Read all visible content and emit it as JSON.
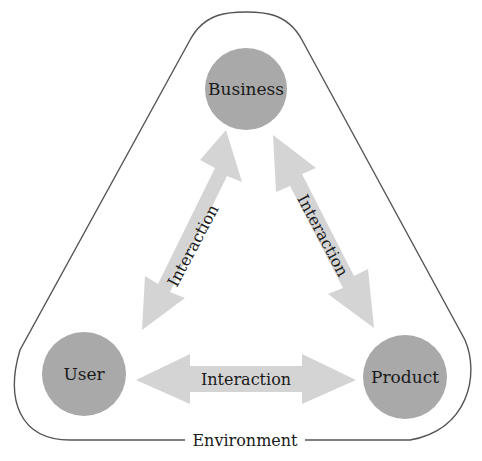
{
  "diagram": {
    "boundary": {
      "label": "Environment",
      "stroke": "#555555"
    },
    "nodes": [
      {
        "id": "business",
        "label": "Business",
        "cx": 246,
        "cy": 89,
        "r": 41,
        "fill": "#a9a9a9"
      },
      {
        "id": "user",
        "label": "User",
        "cx": 84,
        "cy": 374,
        "r": 42,
        "fill": "#a9a9a9"
      },
      {
        "id": "product",
        "label": "Product",
        "cx": 405,
        "cy": 377,
        "r": 42,
        "fill": "#a9a9a9"
      }
    ],
    "edges": [
      {
        "from": "user",
        "to": "business",
        "label": "Interaction",
        "bidirectional": true
      },
      {
        "from": "business",
        "to": "product",
        "label": "Interaction",
        "bidirectional": true
      },
      {
        "from": "user",
        "to": "product",
        "label": "Interaction",
        "bidirectional": true
      }
    ],
    "arrow_fill": "#d4d4d4"
  }
}
